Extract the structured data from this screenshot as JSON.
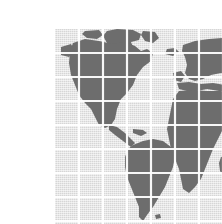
{
  "page": {
    "background_color": "#ffffff",
    "width": 222,
    "height": 224
  },
  "figure": {
    "title": "World Map",
    "alt_text": "Dithered gray world map with white latitude and longitude grid",
    "x": 15,
    "y": 13,
    "width": 193,
    "height": 198,
    "ocean_color": "#d6d6d6",
    "land_color": "#6d6d6d",
    "grid_color": "#ffffff",
    "grid_columns": 8,
    "grid_rows": 8,
    "grid_cell_size": 24,
    "projection": "equirectangular",
    "texture": "halftone-dither"
  },
  "landmasses": [
    {
      "name": "north-america",
      "label": "North America"
    },
    {
      "name": "greenland",
      "label": "Greenland"
    },
    {
      "name": "south-america",
      "label": "South America"
    },
    {
      "name": "europe",
      "label": "Europe"
    },
    {
      "name": "africa",
      "label": "Africa"
    },
    {
      "name": "western-asia",
      "label": "Western Asia"
    },
    {
      "name": "madagascar",
      "label": "Madagascar"
    },
    {
      "name": "british-isles",
      "label": "British Isles"
    },
    {
      "name": "iceland",
      "label": "Iceland"
    },
    {
      "name": "caribbean",
      "label": "Caribbean Islands"
    }
  ],
  "graticule": {
    "vertical_lines": [
      24,
      48,
      72,
      96,
      120,
      144,
      168
    ],
    "horizontal_lines": [
      24,
      48,
      72,
      96,
      120,
      144,
      168,
      192
    ]
  }
}
